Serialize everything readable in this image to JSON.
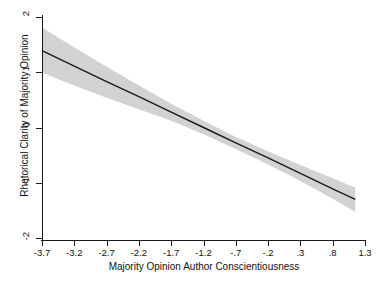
{
  "chart_data": {
    "type": "line",
    "title": "",
    "subtitle": "",
    "xlabel": "Majority Opinion Author Conscientiousness",
    "ylabel": "Rhetorical Clarity of Majority Opinion",
    "xlim": [
      -3.7,
      1.3
    ],
    "ylim": [
      -2,
      2
    ],
    "xticks": [
      -3.7,
      -3.2,
      -2.7,
      -2.2,
      -1.7,
      -1.2,
      -0.7,
      -0.2,
      0.3,
      0.8,
      1.3
    ],
    "xticklabels": [
      "-3.7",
      "-3.2",
      "-2.7",
      "-2.2",
      "-1.7",
      "-1.2",
      "-.7",
      "-.2",
      ".3",
      ".8",
      "1.3"
    ],
    "yticks": [
      -2,
      -1,
      0,
      1,
      2
    ],
    "yticklabels": [
      "-2",
      "-1",
      "0",
      "1",
      "2"
    ],
    "grid": false,
    "legend": "none",
    "series": [
      {
        "name": "Predicted Rhetorical Clarity",
        "kind": "line",
        "color": "#1a1a1a",
        "x": [
          -3.7,
          -3.2,
          -2.7,
          -2.2,
          -1.7,
          -1.2,
          -0.7,
          -0.2,
          0.3,
          0.8,
          1.15
        ],
        "values": [
          1.39,
          1.11,
          0.83,
          0.56,
          0.28,
          0.0,
          -0.28,
          -0.55,
          -0.83,
          -1.11,
          -1.3
        ]
      },
      {
        "name": "95% Confidence Interval Upper",
        "kind": "band-upper",
        "color": "#d2d2d2",
        "x": [
          -3.7,
          -3.2,
          -2.7,
          -2.2,
          -1.7,
          -1.2,
          -0.7,
          -0.2,
          0.3,
          0.8,
          1.15
        ],
        "values": [
          1.81,
          1.45,
          1.1,
          0.76,
          0.43,
          0.12,
          -0.17,
          -0.43,
          -0.68,
          -0.92,
          -1.09
        ]
      },
      {
        "name": "95% Confidence Interval Lower",
        "kind": "band-lower",
        "color": "#d2d2d2",
        "x": [
          -3.7,
          -3.2,
          -2.7,
          -2.2,
          -1.7,
          -1.2,
          -0.7,
          -0.2,
          0.3,
          0.8,
          1.15
        ],
        "values": [
          0.99,
          0.76,
          0.54,
          0.33,
          0.12,
          -0.12,
          -0.39,
          -0.67,
          -0.97,
          -1.29,
          -1.53
        ]
      }
    ],
    "annotations": []
  },
  "axes": {
    "y_title": "Rhetorical Clarity of Majority Opinion",
    "x_title": "Majority Opinion Author Conscientiousness"
  },
  "style": {
    "band_color": "#d2d2d2",
    "line_color": "#1a1a1a",
    "axis_color": "#1a1a1a",
    "background": "#ffffff"
  }
}
